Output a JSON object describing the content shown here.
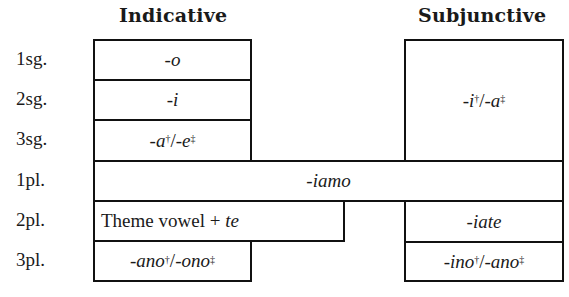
{
  "headings": {
    "indicative": "Indicative",
    "subjunctive": "Subjunctive"
  },
  "row_labels": [
    "1sg.",
    "2sg.",
    "3sg.",
    "1pl.",
    "2pl.",
    "3pl."
  ],
  "indicative": {
    "1sg": "-o",
    "2sg": "-i",
    "3sg": {
      "a": "-a",
      "a_mark": "†",
      "sep": " / ",
      "b": "-e",
      "b_mark": "‡"
    },
    "2pl": {
      "text": "Theme vowel + ",
      "italic": "te"
    },
    "3pl": {
      "a": "-ano",
      "a_mark": "†",
      "sep": "/",
      "b": "-ono",
      "b_mark": "‡"
    }
  },
  "shared": {
    "1pl": "-iamo"
  },
  "subjunctive": {
    "singular": {
      "a": "-i",
      "a_mark": "†",
      "sep": " / ",
      "b": "-a",
      "b_mark": "‡"
    },
    "2pl": "-iate",
    "3pl": {
      "a": "-ino",
      "a_mark": "†",
      "sep": " / ",
      "b": "-ano",
      "b_mark": "‡"
    }
  }
}
